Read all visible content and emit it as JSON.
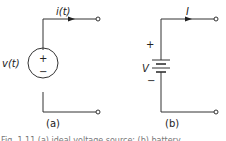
{
  "figure": {
    "panels": [
      {
        "id": "a",
        "label": "(a)",
        "source_type": "ideal voltage source",
        "source_label": "v(t)",
        "current_label": "i(t)",
        "plus": "+",
        "minus": "−"
      },
      {
        "id": "b",
        "label": "(b)",
        "source_type": "battery (DC source)",
        "source_label": "V",
        "current_label": "I",
        "plus": "+",
        "minus": "−"
      }
    ],
    "caption": "Fig. 1.11  (a) ideal voltage source; (b) battery"
  },
  "colors": {
    "line": "#333333",
    "background": "#ffffff"
  }
}
